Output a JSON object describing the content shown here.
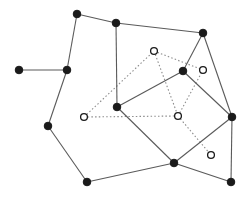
{
  "diagram": {
    "type": "graph",
    "colors": {
      "solid_edge": "#5a5a5a",
      "dotted_edge": "#8c8c8c",
      "filled_node": "#1a1a1a",
      "open_node_fill": "#ffffff",
      "background": "#ffffff"
    },
    "filled_nodes": [
      {
        "id": "A",
        "x": 19,
        "y": 70
      },
      {
        "id": "B",
        "x": 67,
        "y": 70
      },
      {
        "id": "C",
        "x": 77,
        "y": 14
      },
      {
        "id": "D",
        "x": 116,
        "y": 23
      },
      {
        "id": "E",
        "x": 203,
        "y": 33
      },
      {
        "id": "F",
        "x": 183,
        "y": 71
      },
      {
        "id": "G",
        "x": 117,
        "y": 107
      },
      {
        "id": "H",
        "x": 48,
        "y": 126
      },
      {
        "id": "I",
        "x": 232,
        "y": 117
      },
      {
        "id": "J",
        "x": 174,
        "y": 163
      },
      {
        "id": "K",
        "x": 87,
        "y": 182
      },
      {
        "id": "L",
        "x": 231,
        "y": 182
      }
    ],
    "open_nodes": [
      {
        "id": "P",
        "x": 154,
        "y": 51
      },
      {
        "id": "Q",
        "x": 203,
        "y": 70
      },
      {
        "id": "R",
        "x": 84,
        "y": 117
      },
      {
        "id": "S",
        "x": 178,
        "y": 116
      },
      {
        "id": "T",
        "x": 211,
        "y": 155
      }
    ],
    "solid_edges": [
      [
        "A",
        "B"
      ],
      [
        "B",
        "C"
      ],
      [
        "C",
        "D"
      ],
      [
        "D",
        "E"
      ],
      [
        "D",
        "G"
      ],
      [
        "B",
        "H"
      ],
      [
        "H",
        "K"
      ],
      [
        "K",
        "J"
      ],
      [
        "J",
        "G"
      ],
      [
        "J",
        "I"
      ],
      [
        "J",
        "L"
      ],
      [
        "I",
        "L"
      ],
      [
        "E",
        "F"
      ],
      [
        "E",
        "I"
      ],
      [
        "F",
        "G"
      ],
      [
        "F",
        "I"
      ]
    ],
    "dotted_edges": [
      [
        "R",
        "P"
      ],
      [
        "P",
        "Q"
      ],
      [
        "P",
        "S"
      ],
      [
        "R",
        "S"
      ],
      [
        "S",
        "Q"
      ],
      [
        "S",
        "T"
      ]
    ]
  }
}
